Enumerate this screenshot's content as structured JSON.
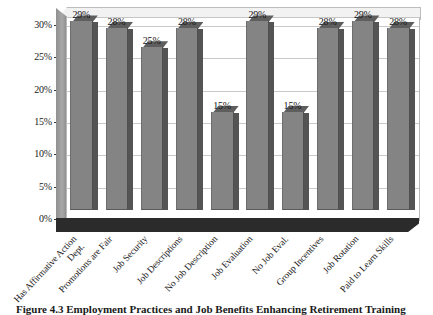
{
  "chart_data": {
    "type": "bar",
    "title": "",
    "subtitle": "",
    "xlabel": "",
    "ylabel": "",
    "ylim": [
      0,
      30
    ],
    "grid": true,
    "legend": "none",
    "style": "3d-column-grayscale",
    "ytick_labels": [
      "0%",
      "5%",
      "10%",
      "15%",
      "20%",
      "25%",
      "30%"
    ],
    "ytick_values": [
      0,
      5,
      10,
      15,
      20,
      25,
      30
    ],
    "categories": [
      "Has Affirmative Action Dept.",
      "Promotions are Fair",
      "Job Security",
      "Job Descriptions",
      "No Job Description",
      "Job Evaluation",
      "No Job Eval.",
      "Group Incentives",
      "Job Rotation",
      "Paid to Learn Skills"
    ],
    "values": [
      29,
      28,
      25,
      28,
      15,
      29,
      15,
      28,
      29,
      28
    ],
    "data_labels": [
      "29%",
      "28%",
      "25%",
      "28%",
      "15%",
      "29%",
      "15%",
      "28%",
      "29%",
      "28%"
    ],
    "colors": {
      "bar_face": "#848484",
      "bar_side": "#545454",
      "bar_top": "#5e5e5e",
      "plot_background": "#ffffff",
      "gridline": "#c9c9c9",
      "floor": "#2b2b2b",
      "text": "#1a1a1a"
    }
  },
  "figure": {
    "caption": "Figure 4.3 Employment Practices and Job Benefits Enhancing Retirement Training"
  },
  "axis_label_lines": [
    [
      "Has Affirmative Action",
      "Dept."
    ],
    [
      "Promotions are Fair"
    ],
    [
      "Job Security"
    ],
    [
      "Job Descriptions"
    ],
    [
      "No Job Description"
    ],
    [
      "Job Evaluation"
    ],
    [
      "No Job Eval."
    ],
    [
      "Group Incentives"
    ],
    [
      "Job Rotation"
    ],
    [
      "Paid to Learn Skills"
    ]
  ]
}
